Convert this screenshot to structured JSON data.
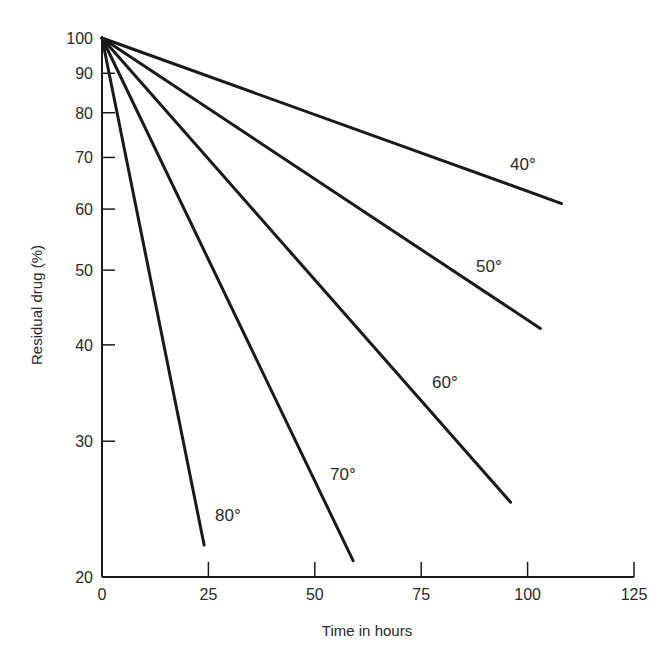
{
  "chart_data": {
    "type": "line",
    "title": "",
    "xlabel": "Time in hours",
    "ylabel": "Residual drug (%)",
    "yscale": "log",
    "xlim": [
      0,
      125
    ],
    "ylim": [
      20,
      100
    ],
    "x_ticks": [
      0,
      25,
      50,
      75,
      100,
      125
    ],
    "y_ticks": [
      20,
      30,
      40,
      50,
      60,
      70,
      80,
      90,
      100
    ],
    "grid": false,
    "legend": "inline labels at line ends",
    "series": [
      {
        "name": "40°",
        "x": [
          0,
          108
        ],
        "values": [
          100,
          61
        ]
      },
      {
        "name": "50°",
        "x": [
          0,
          103
        ],
        "values": [
          100,
          42
        ]
      },
      {
        "name": "60°",
        "x": [
          0,
          96
        ],
        "values": [
          100,
          25
        ]
      },
      {
        "name": "70°",
        "x": [
          0,
          59
        ],
        "values": [
          100,
          21
        ]
      },
      {
        "name": "80°",
        "x": [
          0,
          24
        ],
        "values": [
          100,
          22
        ]
      }
    ]
  },
  "labels": {
    "l40": "40°",
    "l50": "50°",
    "l60": "60°",
    "l70": "70°",
    "l80": "80°"
  },
  "colors": {
    "line": "#1a1a1a",
    "text": "#2a2a2a",
    "background": "#ffffff"
  }
}
